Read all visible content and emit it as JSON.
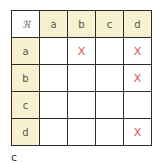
{
  "table": {
    "corner": "ℜ",
    "columns": [
      "a",
      "b",
      "c",
      "d"
    ],
    "rows": [
      {
        "label": "a",
        "cells": [
          "",
          "X",
          "",
          "X"
        ]
      },
      {
        "label": "b",
        "cells": [
          "",
          "",
          "",
          "X"
        ]
      },
      {
        "label": "c",
        "cells": [
          "",
          "",
          "",
          ""
        ]
      },
      {
        "label": "d",
        "cells": [
          "",
          "",
          "",
          "X"
        ]
      }
    ]
  },
  "caption": "c",
  "colors": {
    "header_bg": "#f8f1cf",
    "mark": "#d9534f",
    "border": "#2b2b2b"
  }
}
